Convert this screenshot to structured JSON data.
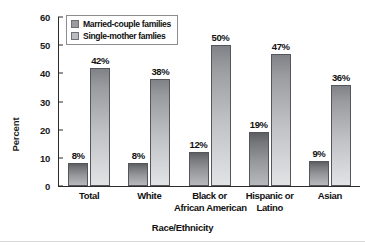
{
  "chart_data": {
    "type": "bar",
    "title": "",
    "xlabel": "Race/Ethnicity",
    "ylabel": "Percent",
    "ylim": [
      0,
      60
    ],
    "yticks": [
      0,
      10,
      20,
      30,
      40,
      50,
      60
    ],
    "grid": false,
    "legend_position": "top-left-inside",
    "categories": [
      "Total",
      "Black or African American",
      "White",
      "Hispanic or Latino",
      "Asian"
    ],
    "category_lines": [
      [
        "Total"
      ],
      [
        "White"
      ],
      [
        "Black or",
        "African American"
      ],
      [
        "Hispanic or",
        "Latino"
      ],
      [
        "Asian"
      ]
    ],
    "series": [
      {
        "name": "Married-couple families",
        "color": "#9a9ca0",
        "values": [
          8,
          8,
          12,
          19,
          9
        ],
        "labels": [
          "8%",
          "8%",
          "12%",
          "19%",
          "9%"
        ]
      },
      {
        "name": "Single-mother famlies",
        "color": "#b9bbbf",
        "values": [
          42,
          38,
          50,
          47,
          36
        ],
        "labels": [
          "42%",
          "38%",
          "50%",
          "47%",
          "36%"
        ]
      }
    ]
  },
  "axes": {
    "y_tick_labels": [
      "0",
      "10",
      "20",
      "30",
      "40",
      "50",
      "60"
    ],
    "y_axis_title": "Percent",
    "x_axis_title": "Race/Ethnicity"
  },
  "legend": {
    "items": [
      {
        "label": "Married-couple families"
      },
      {
        "label": "Single-mother famlies"
      }
    ]
  },
  "categories_display": [
    {
      "line1": "Total",
      "line2": ""
    },
    {
      "line1": "White",
      "line2": ""
    },
    {
      "line1": "Black or",
      "line2": "African American"
    },
    {
      "line1": "Hispanic or",
      "line2": "Latino"
    },
    {
      "line1": "Asian",
      "line2": ""
    }
  ],
  "bar_labels": {
    "g0": {
      "married": "8%",
      "single": "42%"
    },
    "g1": {
      "married": "8%",
      "single": "38%"
    },
    "g2": {
      "married": "12%",
      "single": "50%"
    },
    "g3": {
      "married": "19%",
      "single": "47%"
    },
    "g4": {
      "married": "9%",
      "single": "36%"
    }
  },
  "colors": {
    "married_bar": "#9a9ca0",
    "single_bar": "#c0c2c6",
    "axis": "#2b2b2b",
    "text": "#111111",
    "background": "#ffffff"
  }
}
